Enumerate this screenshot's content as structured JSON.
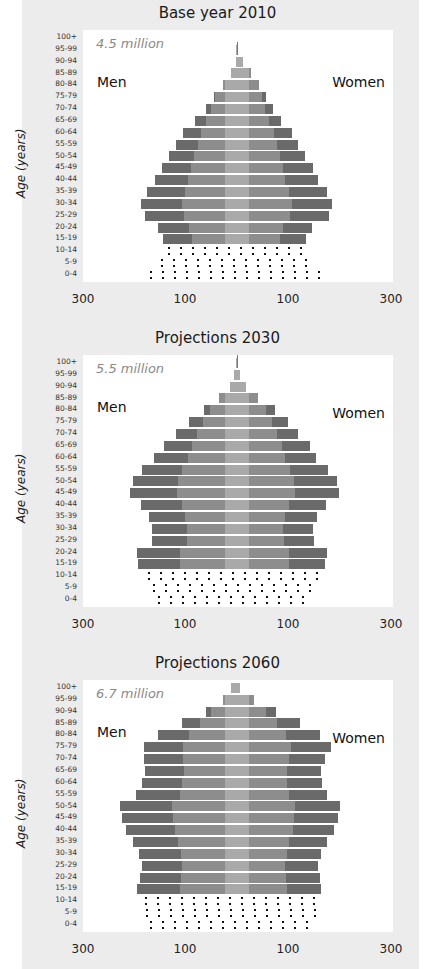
{
  "chart_data": [
    {
      "type": "bar",
      "subtype": "population-pyramid",
      "title": "Base year 2010",
      "total": "4.5 million",
      "left_label": "Men",
      "right_label": "Women",
      "ylabel": "Age (years)",
      "xticks": [
        "300",
        "100",
        "100",
        "300"
      ],
      "categories": [
        "100+",
        "95-99",
        "90-94",
        "85-89",
        "80-84",
        "75-79",
        "70-74",
        "65-69",
        "60-64",
        "55-59",
        "50-54",
        "45-49",
        "40-44",
        "35-39",
        "30-34",
        "25-29",
        "20-24",
        "15-19",
        "10-14",
        "5-9",
        "0-4"
      ],
      "series": [
        {
          "name": "Men",
          "values": [
            0,
            2,
            2,
            12,
            27,
            45,
            61,
            82,
            106,
            119,
            133,
            147,
            161,
            176,
            188,
            180,
            155,
            145,
            145,
            159,
            180
          ]
        },
        {
          "name": "Women",
          "values": [
            0,
            2,
            12,
            27,
            43,
            57,
            71,
            86,
            108,
            120,
            133,
            149,
            159,
            176,
            186,
            180,
            147,
            135,
            135,
            149,
            173
          ]
        }
      ],
      "projected_shading_rows": [
        "10-14",
        "5-9",
        "0-4"
      ],
      "unit": "thousands"
    },
    {
      "type": "bar",
      "subtype": "population-pyramid",
      "title": "Projections 2030",
      "total": "5.5 million",
      "left_label": "Men",
      "right_label": "Women",
      "ylabel": "Age (years)",
      "xticks": [
        "300",
        "100",
        "100",
        "300"
      ],
      "categories": [
        "100+",
        "95-99",
        "90-94",
        "85-89",
        "80-84",
        "75-79",
        "70-74",
        "65-69",
        "60-64",
        "55-59",
        "50-54",
        "45-49",
        "40-44",
        "35-39",
        "30-34",
        "25-29",
        "20-24",
        "15-19",
        "10-14",
        "5-9",
        "0-4"
      ],
      "series": [
        {
          "name": "Men",
          "values": [
            1,
            6,
            14,
            35,
            65,
            94,
            120,
            143,
            163,
            186,
            204,
            210,
            188,
            173,
            167,
            167,
            196,
            194,
            184,
            175,
            165
          ]
        },
        {
          "name": "Women",
          "values": [
            1,
            6,
            18,
            41,
            75,
            100,
            120,
            143,
            155,
            178,
            196,
            200,
            175,
            157,
            149,
            151,
            176,
            173,
            167,
            159,
            143
          ]
        }
      ],
      "projected_shading_rows": [
        "10-14",
        "5-9",
        "0-4"
      ],
      "unit": "thousands"
    },
    {
      "type": "bar",
      "subtype": "population-pyramid",
      "title": "Projections 2060",
      "total": "6.7 million",
      "left_label": "Men",
      "right_label": "Women",
      "ylabel": "Age (years)",
      "xticks": [
        "300",
        "100",
        "100",
        "300"
      ],
      "categories": [
        "100+",
        "95-99",
        "90-94",
        "85-89",
        "80-84",
        "75-79",
        "70-74",
        "65-69",
        "60-64",
        "55-59",
        "50-54",
        "45-49",
        "40-44",
        "35-39",
        "30-34",
        "25-29",
        "20-24",
        "15-19",
        "10-14",
        "5-9",
        "0-4"
      ],
      "series": [
        {
          "name": "Men",
          "values": [
            12,
            27,
            61,
            108,
            155,
            182,
            182,
            180,
            186,
            198,
            229,
            225,
            218,
            204,
            192,
            186,
            190,
            196,
            190,
            188,
            180
          ]
        },
        {
          "name": "Women",
          "values": [
            6,
            33,
            76,
            124,
            163,
            184,
            173,
            165,
            167,
            176,
            202,
            198,
            190,
            176,
            165,
            159,
            163,
            165,
            163,
            155,
            143
          ]
        }
      ],
      "projected_shading_rows": [
        "10-14",
        "5-9",
        "0-4"
      ],
      "unit": "thousands"
    }
  ],
  "colors": {
    "bar_dark": "#6a6a6a",
    "bar_mid": "#8d8d8d",
    "bar_light": "#a9a9a9",
    "panel_bg": "#ececec",
    "plot_bg": "#ffffff",
    "total_text": "#8a8a8a"
  }
}
